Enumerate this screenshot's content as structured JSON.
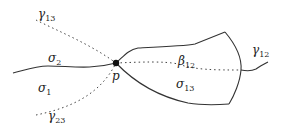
{
  "diagram": {
    "point_label": "p",
    "labels": {
      "gamma13": {
        "base": "γ",
        "sub": "13"
      },
      "gamma23": {
        "base": "γ",
        "sub": "23"
      },
      "gamma12": {
        "base": "γ",
        "sub": "12"
      },
      "sigma1": {
        "base": "σ",
        "sub": "1"
      },
      "sigma2": {
        "base": "σ",
        "sub": "2"
      },
      "sigma13": {
        "base": "σ",
        "sub": "13"
      },
      "beta12": {
        "base": "β",
        "sub": "12"
      }
    },
    "colors": {
      "stroke": "#333333",
      "text": "#222222"
    }
  }
}
